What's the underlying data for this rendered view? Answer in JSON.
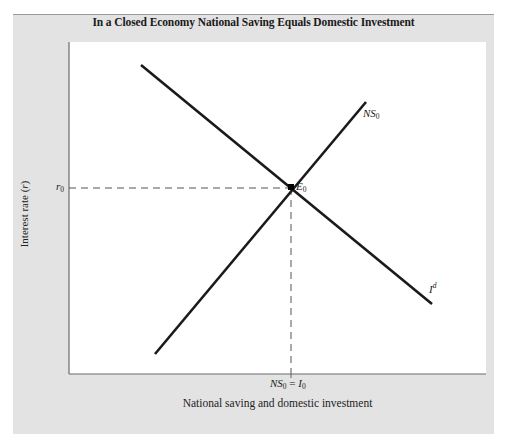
{
  "chart_data": {
    "type": "line",
    "title": "In a Closed Economy National Saving Equals Domestic Investment",
    "xlabel": "National saving and domestic investment",
    "ylabel": "Interest rate (r)",
    "grid": false,
    "legend": "none",
    "series": [
      {
        "name": "NS0",
        "label_main": "NS",
        "label_sub": "0",
        "description": "National saving curve (upward sloping)",
        "color": "#1a1a1a",
        "points": [
          [
            155,
            354
          ],
          [
            366,
            102
          ]
        ]
      },
      {
        "name": "Id",
        "label_main": "I",
        "label_sup": "d",
        "description": "Investment demand curve (downward sloping)",
        "color": "#1a1a1a",
        "points": [
          [
            141,
            65
          ],
          [
            432,
            304
          ]
        ]
      }
    ],
    "equilibrium": {
      "label_main": "E",
      "label_sub": "0",
      "x_pixel": 291,
      "y_pixel": 187
    },
    "x_tick": {
      "label_a": "NS",
      "label_a_sub": "0",
      "equals": "=",
      "label_b": "I",
      "label_b_sub": "0"
    },
    "y_tick": {
      "label": "r",
      "label_sub": "0"
    },
    "ylabel_parts": {
      "text": "Interest rate (",
      "var": "r",
      "close": ")"
    }
  }
}
